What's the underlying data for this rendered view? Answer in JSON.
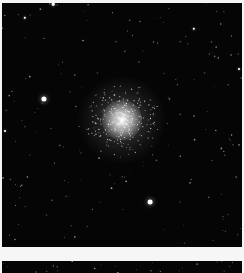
{
  "scene": {
    "description": "Astronomical photograph of a globular star cluster on a black sky background",
    "background_color": "#050505",
    "frame_color": "#f4f4f4",
    "cluster": {
      "center_x": 120,
      "center_y": 117,
      "core_radius": 14,
      "halo_radius": 40,
      "core_color": "#f2f2f2"
    },
    "bright_stars": [
      {
        "x": 42,
        "y": 96,
        "r": 2.6
      },
      {
        "x": 148,
        "y": 199,
        "r": 2.4
      },
      {
        "x": 23,
        "y": 15,
        "r": 1.2
      },
      {
        "x": 192,
        "y": 26,
        "r": 1.2
      },
      {
        "x": 51,
        "y": 1,
        "r": 1.3
      },
      {
        "x": 3,
        "y": 128,
        "r": 1.0
      },
      {
        "x": 237,
        "y": 66,
        "r": 1.0
      }
    ]
  },
  "bottom_panel": {
    "description": "Top edge of a second dark image below a white gap"
  }
}
